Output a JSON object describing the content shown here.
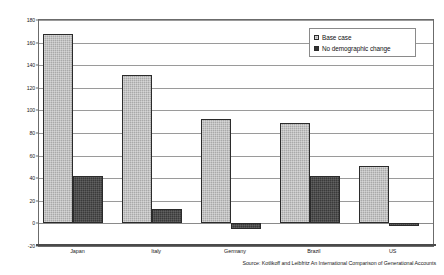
{
  "chart_data": {
    "type": "bar",
    "title": "",
    "xlabel": "",
    "ylabel": "",
    "categories": [
      "Japan",
      "Italy",
      "Germany",
      "Brazil",
      "US"
    ],
    "series": [
      {
        "name": "Base case",
        "values": [
          168,
          131,
          92,
          89,
          51
        ],
        "color": "#a9a9a9"
      },
      {
        "name": "No demographic change",
        "values": [
          42,
          13,
          -5,
          42,
          -2
        ],
        "color": "#3a3a3a"
      }
    ],
    "ylim": [
      -20,
      180
    ],
    "yticks": [
      -20,
      0,
      20,
      40,
      60,
      80,
      100,
      120,
      140,
      160,
      180
    ],
    "ytick_labels": [
      "-20",
      "0",
      "20",
      "40",
      "60",
      "80",
      "100",
      "120",
      "140",
      "160",
      "180"
    ],
    "grid": true,
    "legend_position": "top-right",
    "annotations": [
      "Source: Kotlikoff and Leibfritz An International Comparison of Generational Accounts"
    ]
  },
  "legend": {
    "items": [
      {
        "label": "Base case"
      },
      {
        "label": "No demographic change"
      }
    ]
  },
  "source": {
    "text": "Source: Kotlikoff and Leibfritz An International Comparison of Generational Accounts"
  }
}
